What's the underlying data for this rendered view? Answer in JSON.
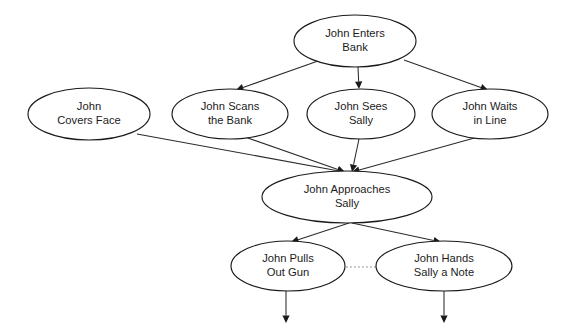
{
  "diagram": {
    "type": "flowchart",
    "background_color": "#ffffff",
    "node_shape": "ellipse",
    "node_fill": "#ffffff",
    "node_stroke": "#1a1a1a",
    "edge_color": "#2b2b2b",
    "dotted_edge_color": "#8e8e8e",
    "text_color": "#1c1c1c",
    "nodes": [
      {
        "id": "enters-bank",
        "line1": "John Enters",
        "line2": "Bank",
        "cx": 355,
        "cy": 41,
        "rx": 61,
        "ry": 26
      },
      {
        "id": "covers-face",
        "line1": "John",
        "line2": "Covers Face",
        "cx": 89,
        "cy": 114,
        "rx": 61,
        "ry": 26
      },
      {
        "id": "scans-bank",
        "line1": "John Scans",
        "line2": "the Bank",
        "cx": 230,
        "cy": 114,
        "rx": 58,
        "ry": 25
      },
      {
        "id": "sees-sally",
        "line1": "John Sees",
        "line2": "Sally",
        "cx": 361,
        "cy": 114,
        "rx": 54,
        "ry": 25
      },
      {
        "id": "waits-in-line",
        "line1": "John Waits",
        "line2": "in Line",
        "cx": 490,
        "cy": 114,
        "rx": 58,
        "ry": 25
      },
      {
        "id": "approaches-sally",
        "line1": "John Approaches",
        "line2": "Sally",
        "cx": 347,
        "cy": 197,
        "rx": 85,
        "ry": 26
      },
      {
        "id": "pulls-out-gun",
        "line1": "John Pulls",
        "line2": "Out Gun",
        "cx": 288,
        "cy": 266,
        "rx": 57,
        "ry": 25
      },
      {
        "id": "hands-note",
        "line1": "John Hands",
        "line2": "Sally a Note",
        "cx": 444,
        "cy": 266,
        "rx": 68,
        "ry": 25
      }
    ],
    "edges": [
      {
        "id": "enters-to-scans",
        "from": "enters-bank",
        "to": "scans-bank",
        "style": "solid",
        "arrow": true,
        "x1": 318,
        "y1": 61,
        "x2": 236,
        "y2": 90
      },
      {
        "id": "enters-to-sees",
        "from": "enters-bank",
        "to": "sees-sally",
        "style": "solid",
        "arrow": true,
        "x1": 358,
        "y1": 67,
        "x2": 359,
        "y2": 89
      },
      {
        "id": "enters-to-waits",
        "from": "enters-bank",
        "to": "waits-in-line",
        "style": "solid",
        "arrow": true,
        "x1": 404,
        "y1": 60,
        "x2": 488,
        "y2": 90
      },
      {
        "id": "covers-to-approaches",
        "from": "covers-face",
        "to": "approaches-sally",
        "style": "solid",
        "arrow": true,
        "x1": 137,
        "y1": 134,
        "x2": 345,
        "y2": 172
      },
      {
        "id": "scans-to-approaches",
        "from": "scans-bank",
        "to": "approaches-sally",
        "style": "solid",
        "arrow": true,
        "x1": 245,
        "y1": 137,
        "x2": 345,
        "y2": 172
      },
      {
        "id": "sees-to-approaches",
        "from": "sees-sally",
        "to": "approaches-sally",
        "style": "solid",
        "arrow": true,
        "x1": 359,
        "y1": 139,
        "x2": 352,
        "y2": 172
      },
      {
        "id": "waits-to-approaches",
        "from": "waits-in-line",
        "to": "approaches-sally",
        "style": "solid",
        "arrow": true,
        "x1": 478,
        "y1": 137,
        "x2": 352,
        "y2": 172
      },
      {
        "id": "approaches-to-gun",
        "from": "approaches-sally",
        "to": "pulls-out-gun",
        "style": "solid",
        "arrow": true,
        "x1": 349,
        "y1": 223,
        "x2": 291,
        "y2": 242
      },
      {
        "id": "approaches-to-note",
        "from": "approaches-sally",
        "to": "hands-note",
        "style": "solid",
        "arrow": true,
        "x1": 352,
        "y1": 223,
        "x2": 441,
        "y2": 242
      },
      {
        "id": "gun-to-note-link",
        "from": "pulls-out-gun",
        "to": "hands-note",
        "style": "dotted",
        "arrow": false,
        "x1": 346,
        "y1": 267,
        "x2": 376,
        "y2": 267
      },
      {
        "id": "gun-outflow",
        "from": "pulls-out-gun",
        "to": null,
        "style": "solid",
        "arrow": true,
        "x1": 286,
        "y1": 291,
        "x2": 286,
        "y2": 323
      },
      {
        "id": "note-outflow",
        "from": "hands-note",
        "to": null,
        "style": "solid",
        "arrow": true,
        "x1": 444,
        "y1": 291,
        "x2": 444,
        "y2": 323
      }
    ]
  }
}
